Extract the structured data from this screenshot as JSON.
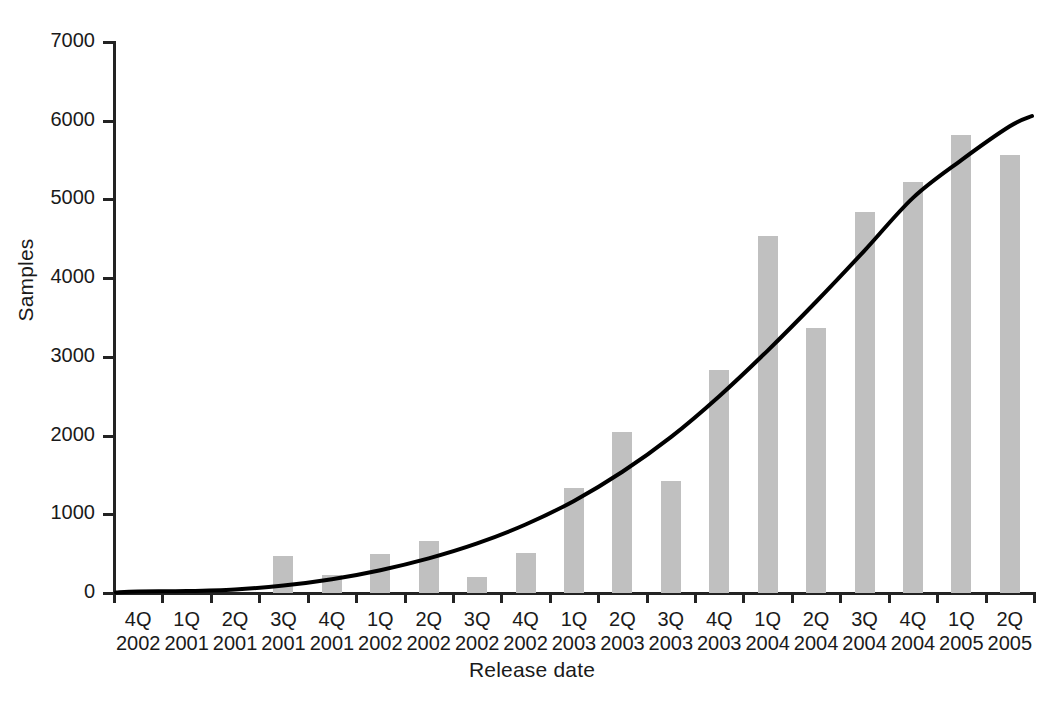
{
  "chart_data": {
    "type": "bar",
    "title": "",
    "xlabel": "Release date",
    "ylabel": "Samples",
    "ylim": [
      0,
      7000
    ],
    "ytick_values": [
      0,
      1000,
      2000,
      3000,
      4000,
      5000,
      6000,
      7000
    ],
    "ytick_labels": [
      "0",
      "1000",
      "2000",
      "3000",
      "4000",
      "5000",
      "6000",
      "7000"
    ],
    "grid": false,
    "legend": "none",
    "categories": [
      "4Q 2002",
      "1Q 2001",
      "2Q 2001",
      "3Q 2001",
      "4Q 2001",
      "1Q 2002",
      "2Q 2002",
      "3Q 2002",
      "4Q 2002",
      "1Q 2003",
      "2Q 2003",
      "3Q 2003",
      "4Q 2003",
      "1Q 2004",
      "2Q 2004",
      "3Q 2004",
      "4Q 2004",
      "1Q 2005",
      "2Q 2005"
    ],
    "category_quarters": [
      "4Q",
      "1Q",
      "2Q",
      "3Q",
      "4Q",
      "1Q",
      "2Q",
      "3Q",
      "4Q",
      "1Q",
      "2Q",
      "3Q",
      "4Q",
      "1Q",
      "2Q",
      "3Q",
      "4Q",
      "1Q",
      "2Q"
    ],
    "category_years": [
      "2002",
      "2001",
      "2001",
      "2001",
      "2001",
      "2002",
      "2002",
      "2002",
      "2002",
      "2003",
      "2003",
      "2003",
      "2003",
      "2004",
      "2004",
      "2004",
      "2004",
      "2005",
      "2005"
    ],
    "values": [
      0,
      0,
      0,
      470,
      230,
      500,
      660,
      200,
      510,
      1330,
      2040,
      1420,
      2830,
      4540,
      3370,
      4840,
      5220,
      5820,
      5570
    ],
    "series": [
      {
        "name": "Samples",
        "type": "bar",
        "color": "#c0c0c0",
        "values": [
          0,
          0,
          0,
          470,
          230,
          500,
          660,
          200,
          510,
          1330,
          2040,
          1420,
          2830,
          4540,
          3370,
          4840,
          5220,
          5820,
          5570
        ]
      },
      {
        "name": "Trend",
        "type": "line",
        "color": "#000000",
        "values": [
          20,
          25,
          45,
          95,
          175,
          290,
          440,
          630,
          870,
          1170,
          1540,
          1980,
          2500,
          3080,
          3700,
          4350,
          5020,
          5500,
          5930
        ]
      }
    ]
  },
  "axis": {
    "y_title": "Samples",
    "x_title": "Release date"
  },
  "colors": {
    "bar": "#c0c0c0",
    "axis": "#232323",
    "trend": "#000000",
    "text": "#1a1a1a",
    "background": "#ffffff"
  }
}
